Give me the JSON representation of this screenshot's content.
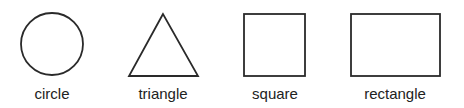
{
  "shapes": [
    {
      "name": "circle",
      "label": "circle"
    },
    {
      "name": "triangle",
      "label": "triangle"
    },
    {
      "name": "square",
      "label": "square"
    },
    {
      "name": "rectangle",
      "label": "rectangle"
    }
  ],
  "colors": {
    "stroke": "#2a2a2a",
    "text": "#222222",
    "background": "#ffffff"
  }
}
